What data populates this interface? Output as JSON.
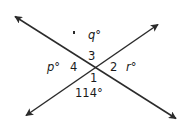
{
  "figure": {
    "background_color": "#ffffff",
    "line_color": "#2b2b2b",
    "text_color": "#1a1a1a",
    "width": 189,
    "height": 134,
    "intersection": {
      "x": 94,
      "y": 70
    },
    "lines": [
      {
        "name": "line-northwest-southeast",
        "from": {
          "x": 13,
          "y": 15
        },
        "to": {
          "x": 178,
          "y": 120
        },
        "arrowheads": "both"
      },
      {
        "name": "line-southwest-northeast",
        "from": {
          "x": 24,
          "y": 117
        },
        "to": {
          "x": 160,
          "y": 23
        },
        "arrowheads": "both"
      }
    ],
    "labels": {
      "q": {
        "text": "q",
        "degree": "°",
        "position": "top"
      },
      "p": {
        "text": "p",
        "degree": "°",
        "position": "left"
      },
      "r": {
        "text": "r",
        "degree": "°",
        "position": "right"
      },
      "angle_1": {
        "text": "1",
        "position": "bottom-center"
      },
      "angle_2": {
        "text": "2",
        "position": "right-center"
      },
      "angle_3": {
        "text": "3",
        "position": "top-center"
      },
      "angle_4": {
        "text": "4",
        "position": "left-center"
      },
      "known_measure": {
        "text": "114°",
        "position": "bottom"
      }
    }
  }
}
